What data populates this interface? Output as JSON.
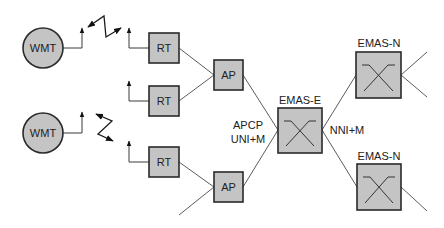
{
  "diagram": {
    "type": "network-architecture",
    "colors": {
      "node_fill": "#c4c4c4",
      "node_stroke": "#2a2a2a",
      "link": "#4a4a4a",
      "background": "#ffffff"
    },
    "nodes": {
      "wmt1": {
        "label": "WMT",
        "shape": "circle"
      },
      "wmt2": {
        "label": "WMT",
        "shape": "circle"
      },
      "rt1": {
        "label": "RT",
        "shape": "box"
      },
      "rt2": {
        "label": "RT",
        "shape": "box"
      },
      "rt3": {
        "label": "RT",
        "shape": "box"
      },
      "ap1": {
        "label": "AP",
        "shape": "box"
      },
      "ap2": {
        "label": "AP",
        "shape": "box"
      },
      "emas_e": {
        "label": "EMAS-E",
        "shape": "switch"
      },
      "emas_n1": {
        "label": "EMAS-N",
        "shape": "switch"
      },
      "emas_n2": {
        "label": "EMAS-N",
        "shape": "switch"
      }
    },
    "interface_labels": {
      "apcp_line1": "APCP",
      "apcp_line2": "UNI+M",
      "nni": "NNI+M"
    },
    "links": [
      {
        "from": "wmt1",
        "to": "rt1",
        "kind": "radio"
      },
      {
        "from": "wmt2",
        "to": "rt3",
        "kind": "radio"
      },
      {
        "from": "rt1",
        "to": "ap1",
        "kind": "wired"
      },
      {
        "from": "rt2",
        "to": "ap1",
        "kind": "wired"
      },
      {
        "from": "rt3",
        "to": "ap2",
        "kind": "wired"
      },
      {
        "from": "ap1",
        "to": "emas_e",
        "kind": "wired"
      },
      {
        "from": "ap2",
        "to": "emas_e",
        "kind": "wired"
      },
      {
        "from": "emas_e",
        "to": "emas_n1",
        "kind": "wired"
      },
      {
        "from": "emas_e",
        "to": "emas_n2",
        "kind": "wired"
      }
    ]
  }
}
